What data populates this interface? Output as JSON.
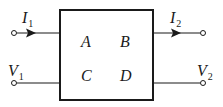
{
  "diagram": {
    "type": "two-port network",
    "colors": {
      "stroke": "#1a1a1a",
      "background": "#ffffff"
    },
    "block": {
      "params": {
        "A": "A",
        "B": "B",
        "C": "C",
        "D": "D"
      }
    },
    "port1": {
      "current": {
        "symbol": "I",
        "sub": "1",
        "direction": "into block"
      },
      "voltage": {
        "symbol": "V",
        "sub": "1"
      }
    },
    "port2": {
      "current": {
        "symbol": "I",
        "sub": "2",
        "direction": "out of block"
      },
      "voltage": {
        "symbol": "V",
        "sub": "2"
      }
    }
  }
}
